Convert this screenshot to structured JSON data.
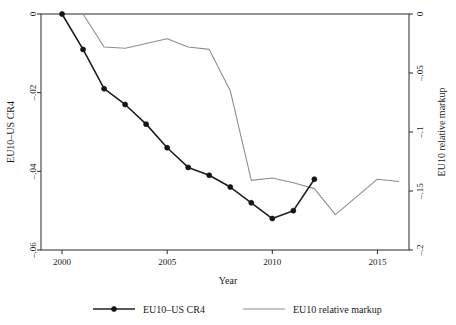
{
  "chart_data": {
    "type": "line",
    "title": "",
    "xlabel": "Year",
    "ylabel": "EU10–US CR4",
    "y2label": "EU10 relative markup",
    "xlim": [
      1999,
      2016.5
    ],
    "ylim": [
      -0.06,
      0.0
    ],
    "y2lim": [
      -0.2,
      0.0
    ],
    "grid": false,
    "legend_position": "bottom",
    "xticks": [
      2000,
      2005,
      2010,
      2015
    ],
    "xticklabels": [
      "2000",
      "2005",
      "2010",
      "2015"
    ],
    "yticks": [
      0,
      -0.02,
      -0.04,
      -0.06
    ],
    "yticklabels": [
      "0",
      "–.02",
      "–.04",
      "–.06"
    ],
    "y2ticks": [
      0,
      -0.05,
      -0.1,
      -0.15,
      -0.2
    ],
    "y2ticklabels": [
      "0",
      "–.05",
      "–.1",
      "–.15",
      "–.2"
    ],
    "series": [
      {
        "name": "EU10–US CR4",
        "axis": "left",
        "color": "#202020",
        "marker": "filled-circle",
        "x": [
          2000,
          2001,
          2002,
          2003,
          2004,
          2005,
          2006,
          2007,
          2008,
          2009,
          2010,
          2011,
          2012
        ],
        "values": [
          0.0,
          -0.009,
          -0.019,
          -0.023,
          -0.028,
          -0.034,
          -0.039,
          -0.041,
          -0.044,
          -0.048,
          -0.052,
          -0.05,
          -0.042
        ]
      },
      {
        "name": "EU10 relative markup",
        "axis": "right",
        "color": "#8e8e8e",
        "marker": "none",
        "x": [
          2000,
          2001,
          2002,
          2003,
          2004,
          2005,
          2006,
          2007,
          2008,
          2009,
          2010,
          2011,
          2012,
          2013,
          2014,
          2015,
          2016
        ],
        "values": [
          0.0,
          0.0,
          -0.028,
          -0.029,
          -0.025,
          -0.021,
          -0.028,
          -0.03,
          -0.065,
          -0.141,
          -0.139,
          -0.143,
          -0.148,
          -0.17,
          -0.155,
          -0.14,
          -0.142
        ]
      }
    ]
  },
  "legend": {
    "items": [
      {
        "label": "EU10–US CR4",
        "swatch": "line-with-marker",
        "color": "#202020"
      },
      {
        "label": "EU10 relative markup",
        "swatch": "line",
        "color": "#8e8e8e"
      }
    ]
  }
}
